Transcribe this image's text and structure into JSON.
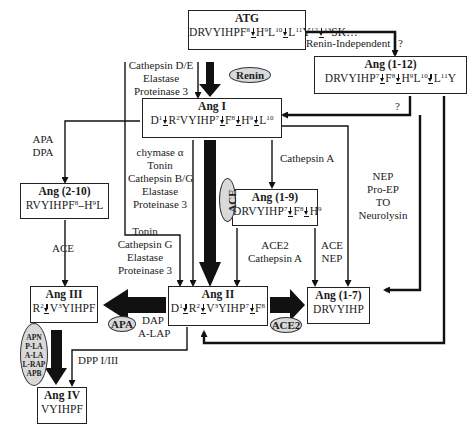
{
  "nodes": {
    "atg": {
      "title": "ATG",
      "seq": [
        "DRVYIHPF",
        "8",
        "cut",
        "H",
        "9",
        "L",
        "10",
        "cut",
        "L",
        "11",
        "Y",
        "12",
        "cut",
        "13",
        "SK…"
      ]
    },
    "ang_1_12": {
      "title": "Ang (1-12)",
      "seq": [
        "DRVYIHP",
        "7",
        "cut",
        "F",
        "8",
        "cut",
        "H",
        "9",
        "L",
        "10",
        "cut",
        "L",
        "11",
        "Y"
      ]
    },
    "ang_i": {
      "title": "Ang I",
      "seq": [
        "D",
        "1",
        "cut",
        "R",
        "2",
        "VYIHP",
        "7",
        "cut",
        "F",
        "8",
        "cut",
        "H",
        "9",
        "cut",
        "L",
        "10"
      ]
    },
    "ang_2_10": {
      "title": "Ang (2-10)",
      "seq": [
        "RVYIHPF",
        "8",
        "–H",
        "9",
        "L"
      ]
    },
    "ang_1_9": {
      "title": "Ang (1-9)",
      "seq": [
        "DRVYIHP",
        "7",
        "cut",
        "F",
        "8",
        "cut",
        "H",
        "9"
      ]
    },
    "ang_iii": {
      "title": "Ang III",
      "seq": [
        "R",
        "2",
        "cut",
        "V",
        "3",
        "YIHPF"
      ]
    },
    "ang_ii": {
      "title": "Ang II",
      "seq": [
        "D",
        "1",
        "cut",
        "R",
        "2",
        "cut",
        "V",
        "3",
        "YIHP",
        "7",
        "cut",
        "F",
        "8"
      ]
    },
    "ang_1_7": {
      "title": "Ang (1-7)",
      "seq": [
        "DRVYIHP"
      ]
    },
    "ang_iv": {
      "title": "Ang IV",
      "seq": [
        "VYIHPF"
      ]
    }
  },
  "enzymes": {
    "renin_independent": "Renin-Independent",
    "question_1": "?",
    "question_2": "?",
    "cathepsin_de": [
      "Cathepsin D/E",
      "Elastase",
      "Proteinase 3"
    ],
    "renin": "Renin",
    "apa_dpa": [
      "APA",
      "DPA"
    ],
    "chymase_group": [
      "chymase  α",
      "Tonin",
      "Cathepsin B/G",
      "Elastase",
      "Proteinase 3"
    ],
    "ace_vertical": "ACE",
    "cathepsin_a": "Cathepsin A",
    "nep_group": [
      "NEP",
      "Pro-EP",
      "TO",
      "Neurolysin"
    ],
    "ace_left": "ACE",
    "tonin_group": [
      "Tonin",
      "Cathepsin G",
      "Elastase",
      "Proteinase 3"
    ],
    "ace2_cathepsin_a": [
      "ACE2",
      "Cathepsin A"
    ],
    "ace_nep": [
      "ACE",
      "NEP"
    ],
    "apa_oval": "APA",
    "dap_alap": [
      "DAP",
      "A-LAP"
    ],
    "ace2_oval": "ACE2",
    "aminopeptidases": [
      "APN",
      "P-LA",
      "A-LA",
      "L-RAP",
      "APB"
    ],
    "dpp": "DPP I/III"
  },
  "colors": {
    "line": "#111111",
    "oval_fill": "#d9d9d9",
    "box_border": "#222222",
    "background": "#ffffff"
  }
}
